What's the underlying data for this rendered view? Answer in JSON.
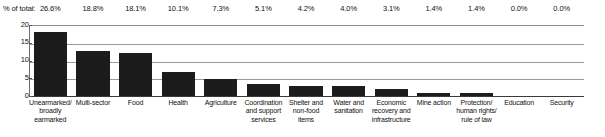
{
  "chart_data": {
    "type": "bar",
    "title": "",
    "xlabel": "",
    "ylabel": "",
    "ylim": [
      0,
      20
    ],
    "yticks": [
      "0",
      "5",
      "10",
      "15",
      "20"
    ],
    "grid": true,
    "legend": "none",
    "bar_color": "#1c1c1c",
    "gridline_color": "#9a9a9a",
    "axis_color": "#3a3a3a",
    "pct_caption": "% of total:",
    "categories": [
      "Unearmarked/ broadly earmarked",
      "Multi-sector",
      "Food",
      "Health",
      "Agriculture",
      "Coordination and support services",
      "Shelter and non-food items",
      "Water and sanitation",
      "Economic recovery and infrastructure",
      "Mine action",
      "Protection/ human rights/ rule of law",
      "Education",
      "Security"
    ],
    "category_lines": [
      [
        "Unearmarked/",
        "broadly",
        "earmarked"
      ],
      [
        "Multi-sector"
      ],
      [
        "Food"
      ],
      [
        "Health"
      ],
      [
        "Agriculture"
      ],
      [
        "Coordination",
        "and support",
        "services"
      ],
      [
        "Shelter and",
        "non-food",
        "items"
      ],
      [
        "Water and",
        "sanitation"
      ],
      [
        "Economic",
        "recovery and",
        "infrastructure"
      ],
      [
        "Mine action"
      ],
      [
        "Protection/",
        "human rights/",
        "rule of law"
      ],
      [
        "Education"
      ],
      [
        "Security"
      ]
    ],
    "values": [
      18.0,
      12.7,
      12.2,
      6.8,
      4.9,
      3.4,
      2.8,
      2.7,
      2.1,
      0.9,
      0.9,
      0.0,
      0.0
    ],
    "pct_of_total": [
      "26.6%",
      "18.8%",
      "18.1%",
      "10.1%",
      "7.3%",
      "5.1%",
      "4.2%",
      "4.0%",
      "3.1%",
      "1.4%",
      "1.4%",
      "0.0%",
      "0.0%"
    ]
  }
}
